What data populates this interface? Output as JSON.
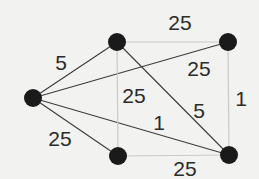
{
  "figure": {
    "name": "weighted-graph-diagram",
    "background_color": "#f2f2f0"
  },
  "style": {
    "node_color": "#1a1a1a",
    "node_radius": 9,
    "edge_dark_color": "#3c3c3c",
    "edge_light_color": "#c9c9c7",
    "label_color": "#2b2b2b"
  },
  "nodes": [
    {
      "id": "left",
      "label": "",
      "x": 33,
      "y": 98
    },
    {
      "id": "top-middle",
      "label": "",
      "x": 117,
      "y": 42
    },
    {
      "id": "top-right",
      "label": "",
      "x": 228,
      "y": 42
    },
    {
      "id": "bottom-middle",
      "label": "",
      "x": 118,
      "y": 156
    },
    {
      "id": "bottom-right",
      "label": "",
      "x": 229,
      "y": 155
    }
  ],
  "edges": [
    {
      "id": "edge-left-topmiddle",
      "from": "left",
      "to": "top-middle",
      "weight": "5",
      "tone": "dark",
      "label_x": 61,
      "label_y": 62
    },
    {
      "id": "edge-left-topright",
      "from": "left",
      "to": "top-right",
      "weight": "25",
      "tone": "dark",
      "label_x": 199,
      "label_y": 68
    },
    {
      "id": "edge-left-bottomright",
      "from": "left",
      "to": "bottom-right",
      "weight": "1",
      "tone": "dark",
      "label_x": 159,
      "label_y": 122
    },
    {
      "id": "edge-left-bottommiddle",
      "from": "left",
      "to": "bottom-middle",
      "weight": "25",
      "tone": "dark",
      "label_x": 60,
      "label_y": 138
    },
    {
      "id": "edge-topmiddle-bottomright",
      "from": "top-middle",
      "to": "bottom-right",
      "weight": "5",
      "tone": "dark",
      "label_x": 199,
      "label_y": 110
    },
    {
      "id": "edge-topmiddle-topright",
      "from": "top-middle",
      "to": "top-right",
      "weight": "25",
      "tone": "light",
      "label_x": 180,
      "label_y": 22
    },
    {
      "id": "edge-topmiddle-bottommiddle",
      "from": "top-middle",
      "to": "bottom-middle",
      "weight": "25",
      "tone": "light",
      "label_x": 134,
      "label_y": 95
    },
    {
      "id": "edge-topright-bottomright",
      "from": "top-right",
      "to": "bottom-right",
      "weight": "1",
      "tone": "light",
      "label_x": 241,
      "label_y": 98
    },
    {
      "id": "edge-bottommiddle-bottomright",
      "from": "bottom-middle",
      "to": "bottom-right",
      "weight": "25",
      "tone": "light",
      "label_x": 185,
      "label_y": 168
    }
  ],
  "chart_data": {
    "type": "diagram",
    "subtype": "weighted-undirected-graph",
    "title": "",
    "node_count": 5,
    "edge_count": 9,
    "node_ids": [
      "left",
      "top-middle",
      "top-right",
      "bottom-middle",
      "bottom-right"
    ],
    "edge_list": [
      [
        "left",
        "top-middle",
        5
      ],
      [
        "left",
        "top-right",
        25
      ],
      [
        "left",
        "bottom-right",
        1
      ],
      [
        "left",
        "bottom-middle",
        25
      ],
      [
        "top-middle",
        "bottom-right",
        5
      ],
      [
        "top-middle",
        "top-right",
        25
      ],
      [
        "top-middle",
        "bottom-middle",
        25
      ],
      [
        "top-right",
        "bottom-right",
        1
      ],
      [
        "bottom-middle",
        "bottom-right",
        25
      ]
    ],
    "weights": [
      5,
      25,
      1,
      25,
      5,
      25,
      25,
      1,
      25
    ],
    "legend": [],
    "xlabel": "",
    "ylabel": ""
  }
}
